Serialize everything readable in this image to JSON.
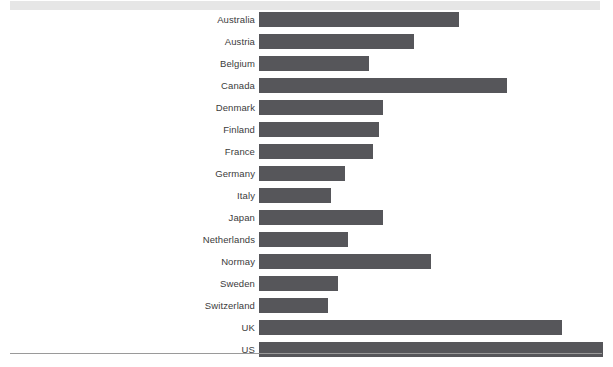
{
  "figure": {
    "header_band": "header-band",
    "bottom_rule": "bottom-rule",
    "band_color": "#e6e6e6",
    "rule_color": "#9a9a9a"
  },
  "chart_data": {
    "type": "bar",
    "orientation": "horizontal",
    "title": "",
    "subtitle": "",
    "xlabel": "",
    "ylabel": "",
    "grid": false,
    "legend": false,
    "axis_ticks_visible": false,
    "xlim": [
      0,
      100
    ],
    "bar_color": "#56565a",
    "label_color": "#3b3b3b",
    "categories": [
      "Australia",
      "Austria",
      "Belgium",
      "Canada",
      "Denmark",
      "Finland",
      "France",
      "Germany",
      "Italy",
      "Japan",
      "Netherlands",
      "Normay",
      "Sweden",
      "Switzerland",
      "UK",
      "US"
    ],
    "values": [
      58,
      45,
      32,
      72,
      36,
      35,
      33,
      25,
      21,
      36,
      26,
      50,
      23,
      20,
      88,
      100
    ]
  }
}
